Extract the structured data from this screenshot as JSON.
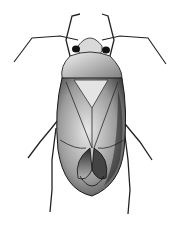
{
  "image": {
    "subject": "insect illustration",
    "style": "black and white stipple drawing",
    "view": "dorsal",
    "colors": {
      "background": "#ffffff",
      "ink": "#111111",
      "shade_dark": "#3a3a3a",
      "shade_mid": "#8a8a8a",
      "shade_light": "#d6d6d6"
    }
  }
}
